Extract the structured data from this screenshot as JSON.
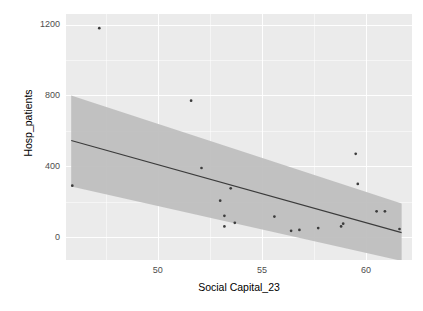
{
  "chart_data": {
    "type": "scatter",
    "title": "",
    "subtitle": "",
    "xlabel": "Social Capital_23",
    "ylabel": "Hosp_patients",
    "xlim": [
      45.6,
      62.2
    ],
    "ylim": [
      -130,
      1260
    ],
    "xticks": [
      50,
      55,
      60
    ],
    "yticks": [
      0,
      400,
      800,
      1200
    ],
    "xtick_labels": [
      "50",
      "55",
      "60"
    ],
    "ytick_labels": [
      "0",
      "400",
      "800",
      "1200"
    ],
    "grid": true,
    "grid_style": "ggplot2-gray-panel-white-gridlines",
    "legend": "none",
    "panel_color": "#ebebeb",
    "point_color": "#3c3c3c",
    "line_color": "#3b3b3b",
    "ribbon_color": "#bebebe",
    "points": [
      {
        "x": 45.9,
        "y": 290
      },
      {
        "x": 47.2,
        "y": 1180
      },
      {
        "x": 51.6,
        "y": 770
      },
      {
        "x": 52.1,
        "y": 390
      },
      {
        "x": 53.0,
        "y": 205
      },
      {
        "x": 53.2,
        "y": 120
      },
      {
        "x": 53.2,
        "y": 60
      },
      {
        "x": 53.5,
        "y": 275
      },
      {
        "x": 53.7,
        "y": 80
      },
      {
        "x": 55.6,
        "y": 115
      },
      {
        "x": 56.4,
        "y": 35
      },
      {
        "x": 56.8,
        "y": 40
      },
      {
        "x": 57.7,
        "y": 50
      },
      {
        "x": 58.8,
        "y": 60
      },
      {
        "x": 58.9,
        "y": 75
      },
      {
        "x": 59.5,
        "y": 470
      },
      {
        "x": 59.6,
        "y": 300
      },
      {
        "x": 60.5,
        "y": 145
      },
      {
        "x": 60.9,
        "y": 145
      },
      {
        "x": 61.6,
        "y": 45
      }
    ],
    "fit_line": {
      "type": "linear",
      "x_start": 45.85,
      "y_start": 545,
      "x_end": 61.7,
      "y_end": 25,
      "se_band": true,
      "band_upper_start": 800,
      "band_lower_start": 285,
      "band_upper_end": 190,
      "band_lower_end": -135
    }
  },
  "axes": {
    "y": {
      "label": "Hosp_patients",
      "ticks": [
        {
          "value": 1200,
          "label": "1200"
        },
        {
          "value": 800,
          "label": "800"
        },
        {
          "value": 400,
          "label": "400"
        },
        {
          "value": 0,
          "label": "0"
        }
      ]
    },
    "x": {
      "label": "Social Capital_23",
      "ticks": [
        {
          "value": 50,
          "label": "50"
        },
        {
          "value": 55,
          "label": "55"
        },
        {
          "value": 60,
          "label": "60"
        }
      ]
    }
  }
}
